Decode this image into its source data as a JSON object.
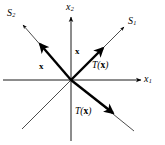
{
  "figure": {
    "name": "linear-transformation-reflection-diagram",
    "background_color": "#ffffff",
    "stroke_color": "#000000",
    "axes": {
      "x_axis_label": "x",
      "x_axis_subscript": "1",
      "y_axis_label": "x",
      "y_axis_subscript": "2",
      "origin": {
        "x": 71,
        "y": 80
      }
    },
    "lines": [
      {
        "label": "S",
        "subscript": "1",
        "description": "line through origin with positive slope (northeast-southwest)",
        "label_position": {
          "x": 128,
          "y": 17
        }
      },
      {
        "label": "S",
        "subscript": "2",
        "description": "line through origin with negative slope (northwest-southeast)",
        "label_position": {
          "x": 7,
          "y": 9
        }
      }
    ],
    "vectors": [
      {
        "name": "x-on-s2",
        "label": "x",
        "description": "bold vector x pointing up-left along line S2",
        "label_position": {
          "x": 39,
          "y": 62
        }
      },
      {
        "name": "x-on-s1",
        "label": "x",
        "description": "bold vector x pointing up-right along line S1",
        "label_position": {
          "x": 75,
          "y": 47
        }
      },
      {
        "name": "Tx-on-s1",
        "label_prefix": "T(",
        "label_arg": "x",
        "label_suffix": ")",
        "description": "bold image vector T(x) pointing up-right along line S1",
        "label_position": {
          "x": 92,
          "y": 61
        }
      },
      {
        "name": "Tx-on-s2",
        "label_prefix": "T(",
        "label_arg": "x",
        "label_suffix": ")",
        "description": "bold image vector T(x) pointing down-right along line S2",
        "label_position": {
          "x": 75,
          "y": 107
        }
      }
    ]
  }
}
